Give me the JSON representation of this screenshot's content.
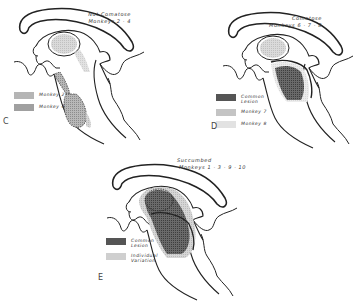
{
  "figure": {
    "panels": [
      {
        "id": "C",
        "letter": "C",
        "title_line1": "Not Comatose",
        "title_line2": "Monkeys 2 · 4",
        "legend": [
          {
            "label": "Monkey 2",
            "pattern": "light-stipple",
            "color": "#b5b5b5"
          },
          {
            "label": "Monkey 4",
            "pattern": "medium-stipple",
            "color": "#a0a0a0"
          }
        ]
      },
      {
        "id": "D",
        "letter": "D",
        "title_line1": "Comatose",
        "title_line2": "Monkeys 6 · 7 · 8",
        "legend": [
          {
            "label": "Common\nLesion",
            "pattern": "dark-stipple",
            "color": "#555555"
          },
          {
            "label": "Monkey 7",
            "pattern": "light-stipple",
            "color": "#c4c4c4"
          },
          {
            "label": "Monkey 8",
            "pattern": "very-light-stipple",
            "color": "#e2e2e2"
          }
        ]
      },
      {
        "id": "E",
        "letter": "E",
        "title_line1": "Succumbed",
        "title_line2": "Monkeys 1 · 3 · 9 · 10",
        "legend": [
          {
            "label": "Common\nLesion",
            "pattern": "dark-stipple",
            "color": "#555555"
          },
          {
            "label": "Individual\nVariation",
            "pattern": "light-stipple",
            "color": "#cfcfcf"
          }
        ]
      }
    ]
  }
}
